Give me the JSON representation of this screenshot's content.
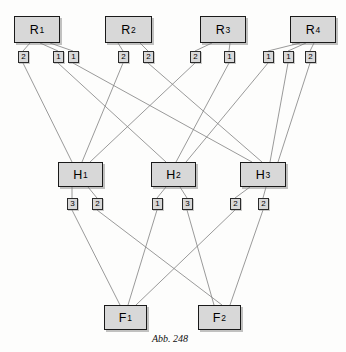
{
  "figure": {
    "caption": "Abb. 248",
    "background_color": "#fdfdfc",
    "node_fill_color": "#d8d8d8",
    "node_border_color": "#1a1a1a",
    "edge_color": "#808080"
  },
  "layers": {
    "resources": {
      "label": "R",
      "nodes": [
        {
          "id": "R1",
          "base": "R",
          "sub": "1",
          "x": 14,
          "y": 16,
          "w": 46,
          "h": 27
        },
        {
          "id": "R2",
          "base": "R",
          "sub": "2",
          "x": 105,
          "y": 16,
          "w": 47,
          "h": 27
        },
        {
          "id": "R3",
          "base": "R",
          "sub": "3",
          "x": 200,
          "y": 16,
          "w": 46,
          "h": 27
        },
        {
          "id": "R4",
          "base": "R",
          "sub": "4",
          "x": 290,
          "y": 16,
          "w": 46,
          "h": 27
        }
      ]
    },
    "intermediates": {
      "label": "H",
      "nodes": [
        {
          "id": "H1",
          "base": "H",
          "sub": "1",
          "x": 58,
          "y": 162,
          "w": 45,
          "h": 25
        },
        {
          "id": "H2",
          "base": "H",
          "sub": "2",
          "x": 151,
          "y": 162,
          "w": 45,
          "h": 25
        },
        {
          "id": "H3",
          "base": "H",
          "sub": "3",
          "x": 240,
          "y": 162,
          "w": 46,
          "h": 25
        }
      ]
    },
    "finals": {
      "label": "F",
      "nodes": [
        {
          "id": "F1",
          "base": "F",
          "sub": "1",
          "x": 104,
          "y": 305,
          "w": 43,
          "h": 25
        },
        {
          "id": "F2",
          "base": "F",
          "sub": "2",
          "x": 198,
          "y": 305,
          "w": 43,
          "h": 25
        }
      ]
    }
  },
  "weights_upper": [
    {
      "id": "w-r1-h1",
      "value": "2",
      "x": 18,
      "y": 51,
      "from": "R1",
      "to": "H1"
    },
    {
      "id": "w-r1-h2",
      "value": "1",
      "x": 53,
      "y": 51,
      "from": "R1",
      "to": "H2"
    },
    {
      "id": "w-r1-h3",
      "value": "1",
      "x": 68,
      "y": 51,
      "from": "R1",
      "to": "H3"
    },
    {
      "id": "w-r2-h1",
      "value": "2",
      "x": 118,
      "y": 51,
      "from": "R2",
      "to": "H1"
    },
    {
      "id": "w-r2-h3",
      "value": "2",
      "x": 143,
      "y": 51,
      "from": "R2",
      "to": "H3"
    },
    {
      "id": "w-r3-h1",
      "value": "2",
      "x": 190,
      "y": 51,
      "from": "R3",
      "to": "H1"
    },
    {
      "id": "w-r3-h2",
      "value": "1",
      "x": 224,
      "y": 51,
      "from": "R3",
      "to": "H2"
    },
    {
      "id": "w-r4-h2",
      "value": "1",
      "x": 263,
      "y": 51,
      "from": "R4",
      "to": "H2"
    },
    {
      "id": "w-r4-h3a",
      "value": "1",
      "x": 283,
      "y": 51,
      "from": "R4",
      "to": "H3"
    },
    {
      "id": "w-r4-h3b",
      "value": "2",
      "x": 305,
      "y": 51,
      "from": "R4",
      "to": "H3"
    }
  ],
  "weights_lower": [
    {
      "id": "w-h1-f1",
      "value": "3",
      "x": 67,
      "y": 198,
      "from": "H1",
      "to": "F1"
    },
    {
      "id": "w-h1-f2",
      "value": "2",
      "x": 92,
      "y": 198,
      "from": "H1",
      "to": "F2"
    },
    {
      "id": "w-h2-f1",
      "value": "1",
      "x": 152,
      "y": 198,
      "from": "H2",
      "to": "F1"
    },
    {
      "id": "w-h2-f2",
      "value": "3",
      "x": 182,
      "y": 198,
      "from": "H2",
      "to": "F2"
    },
    {
      "id": "w-h3-f1",
      "value": "2",
      "x": 230,
      "y": 198,
      "from": "H3",
      "to": "F1"
    },
    {
      "id": "w-h3-f2",
      "value": "2",
      "x": 258,
      "y": 198,
      "from": "H3",
      "to": "F2"
    }
  ],
  "edges_node_to_weight": [
    {
      "x1": 30,
      "y1": 43,
      "x2": 23,
      "y2": 51
    },
    {
      "x1": 40,
      "y1": 43,
      "x2": 58,
      "y2": 51
    },
    {
      "x1": 50,
      "y1": 43,
      "x2": 73,
      "y2": 51
    },
    {
      "x1": 118,
      "y1": 43,
      "x2": 123,
      "y2": 51
    },
    {
      "x1": 140,
      "y1": 43,
      "x2": 148,
      "y2": 51
    },
    {
      "x1": 212,
      "y1": 43,
      "x2": 195,
      "y2": 51
    },
    {
      "x1": 230,
      "y1": 43,
      "x2": 229,
      "y2": 51
    },
    {
      "x1": 300,
      "y1": 43,
      "x2": 268,
      "y2": 51
    },
    {
      "x1": 306,
      "y1": 43,
      "x2": 288,
      "y2": 51
    },
    {
      "x1": 314,
      "y1": 43,
      "x2": 310,
      "y2": 51
    }
  ],
  "edges_weight_to_node": [
    {
      "x1": 23,
      "y1": 63,
      "x2": 72,
      "y2": 162
    },
    {
      "x1": 58,
      "y1": 63,
      "x2": 166,
      "y2": 162
    },
    {
      "x1": 73,
      "y1": 63,
      "x2": 252,
      "y2": 162
    },
    {
      "x1": 123,
      "y1": 63,
      "x2": 82,
      "y2": 162
    },
    {
      "x1": 148,
      "y1": 63,
      "x2": 262,
      "y2": 162
    },
    {
      "x1": 195,
      "y1": 63,
      "x2": 90,
      "y2": 162
    },
    {
      "x1": 229,
      "y1": 63,
      "x2": 176,
      "y2": 162
    },
    {
      "x1": 268,
      "y1": 63,
      "x2": 186,
      "y2": 162
    },
    {
      "x1": 288,
      "y1": 63,
      "x2": 270,
      "y2": 162
    },
    {
      "x1": 310,
      "y1": 63,
      "x2": 278,
      "y2": 162
    }
  ],
  "edges_h_to_weight": [
    {
      "x1": 72,
      "y1": 187,
      "x2": 72,
      "y2": 198
    },
    {
      "x1": 88,
      "y1": 187,
      "x2": 97,
      "y2": 198
    },
    {
      "x1": 166,
      "y1": 187,
      "x2": 157,
      "y2": 198
    },
    {
      "x1": 180,
      "y1": 187,
      "x2": 187,
      "y2": 198
    },
    {
      "x1": 250,
      "y1": 187,
      "x2": 235,
      "y2": 198
    },
    {
      "x1": 266,
      "y1": 187,
      "x2": 263,
      "y2": 198
    }
  ],
  "edges_weight_to_f": [
    {
      "x1": 72,
      "y1": 210,
      "x2": 120,
      "y2": 305
    },
    {
      "x1": 97,
      "y1": 210,
      "x2": 222,
      "y2": 305
    },
    {
      "x1": 157,
      "y1": 210,
      "x2": 128,
      "y2": 305
    },
    {
      "x1": 187,
      "y1": 210,
      "x2": 214,
      "y2": 305
    },
    {
      "x1": 235,
      "y1": 210,
      "x2": 136,
      "y2": 305
    },
    {
      "x1": 263,
      "y1": 210,
      "x2": 230,
      "y2": 305
    }
  ]
}
